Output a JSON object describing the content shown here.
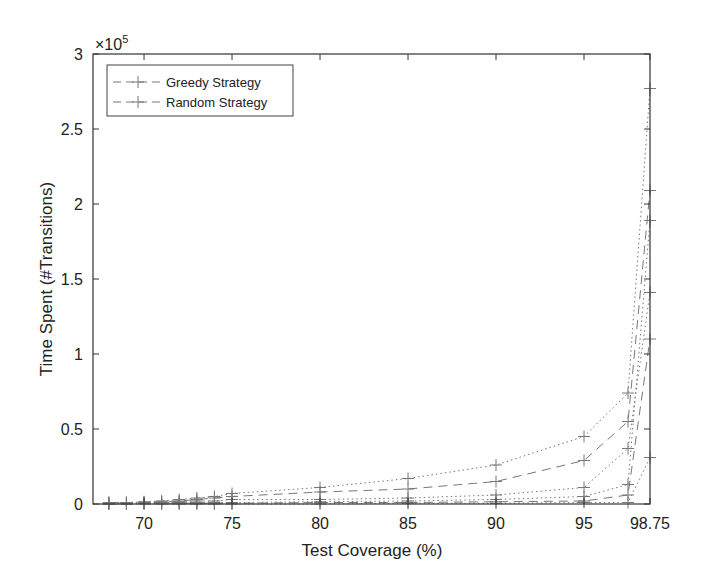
{
  "chart_data": {
    "type": "line",
    "title": "",
    "xlabel": "Test Coverage (%)",
    "ylabel": "Time Spent (#Transitions)",
    "y_multiplier": "×10^5",
    "y_multiplier_base": "×10",
    "y_multiplier_exp": "5",
    "xlim": [
      67.1,
      98.75
    ],
    "ylim": [
      0,
      3
    ],
    "xticks": [
      70,
      75,
      80,
      85,
      90,
      95,
      98.75
    ],
    "xtick_labels": [
      "70",
      "75",
      "80",
      "85",
      "90",
      "95",
      "98.75"
    ],
    "yticks": [
      0,
      0.5,
      1,
      1.5,
      2,
      2.5,
      3
    ],
    "ytick_labels": [
      "0",
      "0.5",
      "1",
      "1.5",
      "2",
      "2.5",
      "3"
    ],
    "grid": false,
    "legend_position": "upper left",
    "legend": [
      "Greedy Strategy",
      "Random Strategy"
    ],
    "x": [
      68,
      69,
      70,
      71,
      72,
      73,
      74,
      75,
      80,
      85,
      90,
      95,
      97.5,
      98.75
    ],
    "series": [
      {
        "name": "Greedy Strategy (upper bound)",
        "style": "dotted",
        "values": [
          0.01,
          0.01,
          0.015,
          0.02,
          0.03,
          0.04,
          0.05,
          0.07,
          0.11,
          0.17,
          0.26,
          0.45,
          0.74,
          2.77
        ]
      },
      {
        "name": "Greedy Strategy",
        "style": "dashed",
        "values": [
          0.01,
          0.01,
          0.01,
          0.015,
          0.02,
          0.03,
          0.04,
          0.05,
          0.08,
          0.1,
          0.15,
          0.29,
          0.55,
          2.09
        ]
      },
      {
        "name": "Greedy Strategy (lower bound)",
        "style": "dotted",
        "values": [
          0.005,
          0.005,
          0.01,
          0.01,
          0.015,
          0.02,
          0.02,
          0.03,
          0.03,
          0.04,
          0.06,
          0.11,
          0.37,
          1.41
        ]
      },
      {
        "name": "Random Strategy (upper bound)",
        "style": "dotted",
        "values": [
          0.005,
          0.005,
          0.005,
          0.01,
          0.01,
          0.01,
          0.01,
          0.01,
          0.015,
          0.02,
          0.03,
          0.05,
          0.13,
          1.89
        ]
      },
      {
        "name": "Random Strategy",
        "style": "dashed",
        "values": [
          0.0,
          0.0,
          0.005,
          0.005,
          0.005,
          0.005,
          0.005,
          0.005,
          0.01,
          0.01,
          0.015,
          0.02,
          0.06,
          1.1
        ]
      },
      {
        "name": "Random Strategy (lower bound)",
        "style": "dotted",
        "values": [
          0.0,
          0.0,
          0.0,
          0.0,
          0.0,
          0.0,
          0.0,
          0.0,
          0.0,
          0.005,
          0.005,
          0.01,
          0.01,
          0.31
        ]
      }
    ],
    "colors": {
      "axis": "#333333",
      "lines": "#777777",
      "text": "#222222"
    }
  }
}
